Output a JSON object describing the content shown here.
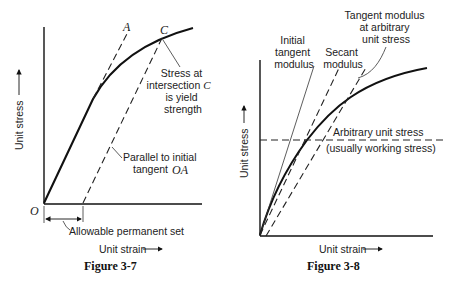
{
  "figures": [
    {
      "caption": "Figure 3-7",
      "ylabel": "Unit stress",
      "xlabel": "Unit strain",
      "origin_label": "O",
      "point_a_label": "A",
      "point_c_label": "C",
      "annotation_yield": [
        "Stress at",
        "intersection",
        "is yield",
        "strength"
      ],
      "annotation_yield_point": "C",
      "annotation_parallel": [
        "Parallel to initial",
        "tangent"
      ],
      "annotation_parallel_ref": "OA",
      "annotation_set": "Allowable permanent set"
    },
    {
      "caption": "Figure 3-8",
      "ylabel": "Unit stress",
      "xlabel": "Unit strain",
      "label_initial": [
        "Initial",
        "tangent",
        "modulus"
      ],
      "label_secant": [
        "Secant",
        "modulus"
      ],
      "label_tangent": [
        "Tangent modulus",
        "at arbitrary",
        "unit stress"
      ],
      "label_arbitrary": "Arbitrary unit stress",
      "label_working": "(usually working stress)"
    }
  ]
}
